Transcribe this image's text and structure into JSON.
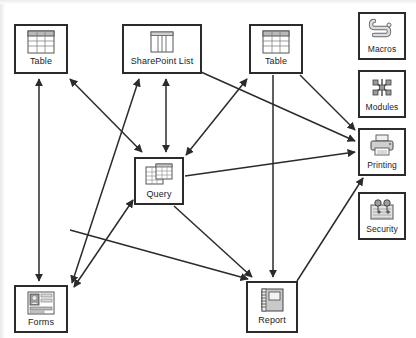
{
  "diagram": {
    "type": "node-link-diagram",
    "canvas": {
      "width": 416,
      "height": 338,
      "background": "#ffffff"
    },
    "stroke_color": "#2b2b2b",
    "nodes": [
      {
        "id": "table_left",
        "label": "Table",
        "icon": "table-icon",
        "x": 14,
        "y": 24,
        "w": 54,
        "h": 50
      },
      {
        "id": "sharepoint_list",
        "label": "SharePoint List",
        "icon": "sharepoint-list-icon",
        "x": 122,
        "y": 24,
        "w": 80,
        "h": 50
      },
      {
        "id": "table_right",
        "label": "Table",
        "icon": "table-icon",
        "x": 249,
        "y": 24,
        "w": 54,
        "h": 50
      },
      {
        "id": "query",
        "label": "Query",
        "icon": "query-icon",
        "x": 134,
        "y": 157,
        "w": 50,
        "h": 48
      },
      {
        "id": "forms",
        "label": "Forms",
        "icon": "forms-icon",
        "x": 14,
        "y": 285,
        "w": 54,
        "h": 48
      },
      {
        "id": "report",
        "label": "Report",
        "icon": "report-icon",
        "x": 246,
        "y": 281,
        "w": 52,
        "h": 52
      },
      {
        "id": "macros",
        "label": "Macros",
        "icon": "macros-scroll-icon",
        "x": 358,
        "y": 12,
        "w": 48,
        "h": 48
      },
      {
        "id": "modules",
        "label": "Modules",
        "icon": "modules-icon",
        "x": 358,
        "y": 70,
        "w": 48,
        "h": 48
      },
      {
        "id": "printing",
        "label": "Printing",
        "icon": "printer-icon",
        "x": 358,
        "y": 128,
        "w": 48,
        "h": 48
      },
      {
        "id": "security",
        "label": "Security",
        "icon": "security-keys-icon",
        "x": 358,
        "y": 192,
        "w": 48,
        "h": 48
      }
    ],
    "edges": [
      {
        "from": "forms",
        "to": "table_left",
        "arrows": "both"
      },
      {
        "from": "query",
        "to": "table_left",
        "arrows": "both"
      },
      {
        "from": "forms",
        "to": "sharepoint_list",
        "arrows": "both"
      },
      {
        "from": "query",
        "to": "sharepoint_list",
        "arrows": "both"
      },
      {
        "from": "query",
        "to": "table_right",
        "arrows": "both"
      },
      {
        "from": "query",
        "to": "forms",
        "arrows": "both"
      },
      {
        "from": "query",
        "to": "report",
        "arrows": "to"
      },
      {
        "from": "query",
        "to": "printing",
        "arrows": "to"
      },
      {
        "from": "table_right",
        "to": "report",
        "arrows": "to"
      },
      {
        "from": "table_right",
        "to": "printing",
        "arrows": "to"
      },
      {
        "from": "sharepoint_list",
        "to": "printing",
        "arrows": "to"
      },
      {
        "from": "forms",
        "to": "report",
        "arrows": "to"
      },
      {
        "from": "report",
        "to": "printing",
        "arrows": "to"
      }
    ]
  }
}
